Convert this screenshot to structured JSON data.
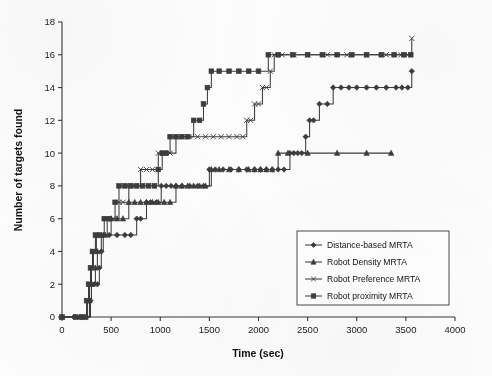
{
  "chart_data": {
    "type": "line",
    "title": "",
    "xlabel": "Time (sec)",
    "ylabel": "Number of targets found",
    "xlim": [
      0,
      4000
    ],
    "ylim": [
      0,
      18
    ],
    "xticks": [
      0,
      500,
      1000,
      1500,
      2000,
      2500,
      3000,
      3500,
      4000
    ],
    "yticks": [
      0,
      2,
      4,
      6,
      8,
      10,
      12,
      14,
      16,
      18
    ],
    "xtick_labels": [
      "0",
      "500",
      "1000",
      "1500",
      "2000",
      "2500",
      "3000",
      "3500",
      "4000"
    ],
    "ytick_labels": [
      "0",
      "2",
      "4",
      "6",
      "8",
      "10",
      "12",
      "14",
      "16",
      "18"
    ],
    "grid": false,
    "legend_position": "lower-right",
    "series": [
      {
        "name": "Distance-based MRTA",
        "marker": "diamond",
        "color": "#3c3c3c",
        "points": [
          [
            0,
            0
          ],
          [
            120,
            0
          ],
          [
            200,
            0
          ],
          [
            250,
            0
          ],
          [
            290,
            1
          ],
          [
            300,
            2
          ],
          [
            330,
            2
          ],
          [
            360,
            2
          ],
          [
            380,
            3
          ],
          [
            400,
            4
          ],
          [
            420,
            5
          ],
          [
            480,
            5
          ],
          [
            560,
            5
          ],
          [
            640,
            5
          ],
          [
            700,
            5
          ],
          [
            760,
            6
          ],
          [
            800,
            6
          ],
          [
            860,
            7
          ],
          [
            900,
            7
          ],
          [
            960,
            7
          ],
          [
            1010,
            8
          ],
          [
            1060,
            8
          ],
          [
            1110,
            8
          ],
          [
            1160,
            8
          ],
          [
            1220,
            8
          ],
          [
            1300,
            8
          ],
          [
            1380,
            8
          ],
          [
            1440,
            8
          ],
          [
            1500,
            9
          ],
          [
            1560,
            9
          ],
          [
            1640,
            9
          ],
          [
            1720,
            9
          ],
          [
            1800,
            9
          ],
          [
            1880,
            9
          ],
          [
            1960,
            9
          ],
          [
            2020,
            9
          ],
          [
            2080,
            9
          ],
          [
            2140,
            9
          ],
          [
            2200,
            9
          ],
          [
            2260,
            9
          ],
          [
            2320,
            10
          ],
          [
            2360,
            10
          ],
          [
            2400,
            10
          ],
          [
            2440,
            10
          ],
          [
            2480,
            11
          ],
          [
            2520,
            12
          ],
          [
            2560,
            12
          ],
          [
            2620,
            13
          ],
          [
            2700,
            13
          ],
          [
            2760,
            14
          ],
          [
            2840,
            14
          ],
          [
            2920,
            14
          ],
          [
            3000,
            14
          ],
          [
            3100,
            14
          ],
          [
            3200,
            14
          ],
          [
            3300,
            14
          ],
          [
            3400,
            14
          ],
          [
            3460,
            14
          ],
          [
            3520,
            14
          ],
          [
            3560,
            15
          ]
        ]
      },
      {
        "name": "Robot Density MRTA",
        "marker": "triangle",
        "color": "#3c3c3c",
        "points": [
          [
            0,
            0
          ],
          [
            180,
            0
          ],
          [
            240,
            0
          ],
          [
            280,
            1
          ],
          [
            300,
            2
          ],
          [
            340,
            3
          ],
          [
            360,
            4
          ],
          [
            400,
            5
          ],
          [
            440,
            5
          ],
          [
            500,
            6
          ],
          [
            560,
            6
          ],
          [
            620,
            6
          ],
          [
            680,
            7
          ],
          [
            740,
            7
          ],
          [
            800,
            7
          ],
          [
            860,
            7
          ],
          [
            920,
            7
          ],
          [
            980,
            7
          ],
          [
            1040,
            7
          ],
          [
            1100,
            7
          ],
          [
            1160,
            8
          ],
          [
            1220,
            8
          ],
          [
            1280,
            8
          ],
          [
            1340,
            8
          ],
          [
            1400,
            8
          ],
          [
            1460,
            8
          ],
          [
            1520,
            9
          ],
          [
            1600,
            9
          ],
          [
            1700,
            9
          ],
          [
            1800,
            9
          ],
          [
            1900,
            9
          ],
          [
            1960,
            9
          ],
          [
            2020,
            9
          ],
          [
            2080,
            9
          ],
          [
            2140,
            9
          ],
          [
            2200,
            10
          ],
          [
            2300,
            10
          ],
          [
            2500,
            10
          ],
          [
            2800,
            10
          ],
          [
            3100,
            10
          ],
          [
            3350,
            10
          ]
        ]
      },
      {
        "name": "Robot Preference MRTA",
        "marker": "x",
        "color": "#3c3c3c",
        "points": [
          [
            0,
            0
          ],
          [
            160,
            0
          ],
          [
            230,
            0
          ],
          [
            260,
            1
          ],
          [
            280,
            2
          ],
          [
            300,
            3
          ],
          [
            320,
            4
          ],
          [
            350,
            5
          ],
          [
            400,
            5
          ],
          [
            460,
            6
          ],
          [
            520,
            6
          ],
          [
            580,
            7
          ],
          [
            620,
            7
          ],
          [
            680,
            8
          ],
          [
            740,
            8
          ],
          [
            800,
            9
          ],
          [
            860,
            9
          ],
          [
            920,
            9
          ],
          [
            980,
            10
          ],
          [
            1040,
            10
          ],
          [
            1100,
            10
          ],
          [
            1160,
            11
          ],
          [
            1220,
            11
          ],
          [
            1300,
            11
          ],
          [
            1380,
            11
          ],
          [
            1460,
            11
          ],
          [
            1540,
            11
          ],
          [
            1620,
            11
          ],
          [
            1700,
            11
          ],
          [
            1780,
            11
          ],
          [
            1840,
            11
          ],
          [
            1880,
            12
          ],
          [
            1920,
            12
          ],
          [
            1960,
            13
          ],
          [
            2000,
            13
          ],
          [
            2040,
            14
          ],
          [
            2080,
            14
          ],
          [
            2120,
            15
          ],
          [
            2160,
            16
          ],
          [
            2240,
            16
          ],
          [
            2360,
            16
          ],
          [
            2500,
            16
          ],
          [
            2700,
            16
          ],
          [
            2900,
            16
          ],
          [
            3100,
            16
          ],
          [
            3300,
            16
          ],
          [
            3450,
            16
          ],
          [
            3520,
            16
          ],
          [
            3560,
            17
          ]
        ]
      },
      {
        "name": "Robot proximity MRTA",
        "marker": "square",
        "color": "#3c3c3c",
        "points": [
          [
            0,
            0
          ],
          [
            140,
            0
          ],
          [
            210,
            0
          ],
          [
            250,
            1
          ],
          [
            270,
            2
          ],
          [
            290,
            3
          ],
          [
            310,
            4
          ],
          [
            340,
            5
          ],
          [
            380,
            5
          ],
          [
            430,
            6
          ],
          [
            480,
            6
          ],
          [
            540,
            7
          ],
          [
            580,
            8
          ],
          [
            640,
            8
          ],
          [
            700,
            8
          ],
          [
            760,
            8
          ],
          [
            820,
            8
          ],
          [
            880,
            8
          ],
          [
            940,
            8
          ],
          [
            980,
            9
          ],
          [
            1020,
            10
          ],
          [
            1060,
            10
          ],
          [
            1100,
            11
          ],
          [
            1160,
            11
          ],
          [
            1220,
            11
          ],
          [
            1280,
            11
          ],
          [
            1340,
            12
          ],
          [
            1400,
            12
          ],
          [
            1440,
            13
          ],
          [
            1480,
            14
          ],
          [
            1520,
            15
          ],
          [
            1600,
            15
          ],
          [
            1700,
            15
          ],
          [
            1800,
            15
          ],
          [
            1900,
            15
          ],
          [
            2000,
            15
          ],
          [
            2100,
            16
          ],
          [
            2200,
            16
          ],
          [
            2350,
            16
          ],
          [
            2500,
            16
          ],
          [
            2650,
            16
          ],
          [
            2800,
            16
          ],
          [
            2950,
            16
          ],
          [
            3100,
            16
          ],
          [
            3250,
            16
          ],
          [
            3380,
            16
          ],
          [
            3480,
            16
          ],
          [
            3550,
            16
          ]
        ]
      }
    ]
  },
  "legend": {
    "entries": [
      {
        "label": "Distance-based MRTA",
        "marker": "diamond"
      },
      {
        "label": "Robot Density MRTA",
        "marker": "triangle"
      },
      {
        "label": "Robot Preference MRTA",
        "marker": "x"
      },
      {
        "label": "Robot proximity MRTA",
        "marker": "square"
      }
    ]
  }
}
